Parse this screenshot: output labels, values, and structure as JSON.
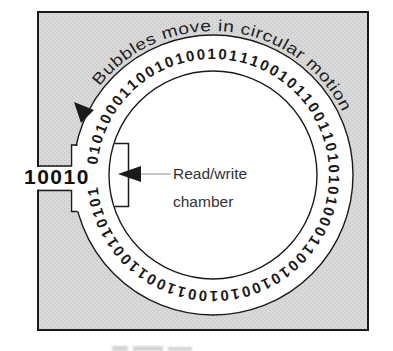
{
  "labels": {
    "curved": "Bubbles move in circular motion",
    "input_bits": "10010",
    "chamber_line1": "Read/write",
    "chamber_line2": "chamber"
  },
  "ring": {
    "bits": "01010001100101001011100101100110101010001100101001010011001100110101",
    "bit_count": 68
  },
  "colors": {
    "chip_fill": "#dadada",
    "chip_dot": "#c4c4c4",
    "line": "#1a1a1a",
    "track_fill": "#ffffff",
    "leader_line": "#a0a0a0",
    "label_text": "#333333",
    "caption_smudge": "#c9c9c9"
  }
}
